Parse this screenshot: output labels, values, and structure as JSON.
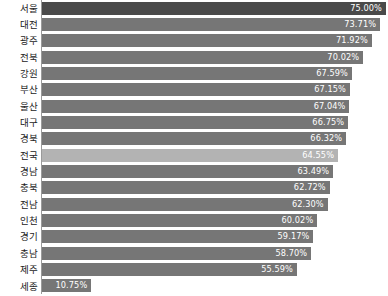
{
  "chart_data": {
    "type": "bar",
    "orientation": "horizontal",
    "title": "",
    "subtitle": "",
    "xlabel": "",
    "ylabel": "",
    "grid": false,
    "legend": false,
    "axis_visible": "y-axis-line-only",
    "xlim": [
      0,
      75
    ],
    "value_suffix": "%",
    "value_label_position": "inside-end",
    "categories": [
      "서울",
      "대전",
      "광주",
      "전북",
      "강원",
      "부산",
      "울산",
      "대구",
      "경북",
      "전국",
      "경남",
      "충북",
      "전남",
      "인천",
      "경기",
      "충남",
      "제주",
      "세종"
    ],
    "values": [
      75.0,
      73.71,
      71.92,
      70.02,
      67.59,
      67.15,
      67.04,
      66.75,
      66.32,
      64.55,
      63.49,
      62.72,
      62.3,
      60.02,
      59.17,
      58.7,
      55.59,
      10.75
    ],
    "value_labels": [
      "75.00%",
      "73.71%",
      "71.92%",
      "70.02%",
      "67.59%",
      "67.15%",
      "67.04%",
      "66.75%",
      "66.32%",
      "64.55%",
      "63.49%",
      "62.72%",
      "62.30%",
      "60.02%",
      "59.17%",
      "58.70%",
      "55.59%",
      "10.75%"
    ],
    "bar_styles": [
      "first",
      "",
      "",
      "",
      "",
      "",
      "",
      "",
      "",
      "highlight",
      "",
      "",
      "",
      "",
      "",
      "",
      "",
      ""
    ],
    "colors": {
      "bar_default": "#767676",
      "bar_first": "#4a4a4a",
      "bar_highlight": "#b3b3b3",
      "value_text": "#ffffff",
      "category_text": "#232323",
      "axis_line": "#9a9a9a",
      "background": "#ffffff"
    }
  }
}
